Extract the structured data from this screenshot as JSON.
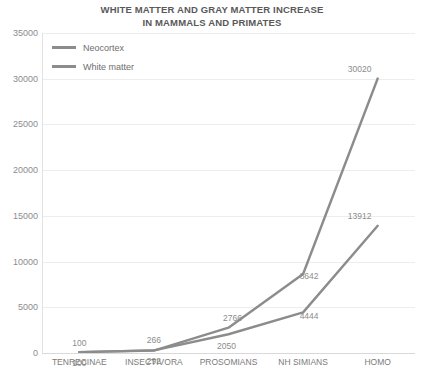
{
  "chart_data": {
    "type": "line",
    "title": "WHITE MATTER AND GRAY MATTER INCREASE IN MAMMALS AND PRIMATES",
    "title_line1": "WHITE MATTER AND GRAY MATTER INCREASE",
    "title_line2": "IN MAMMALS AND PRIMATES",
    "xlabel": "",
    "ylabel": "",
    "categories": [
      "TENRECINAE",
      "INSECTIVORA",
      "PROSOMIANS",
      "NH SIMIANS",
      "HOMO"
    ],
    "series": [
      {
        "name": "Neocortex",
        "color": "#8c8c8c",
        "values": [
          100,
          266,
          2766,
          8642,
          30020
        ],
        "labels": [
          "100",
          "266",
          "2766",
          "8642",
          "30020"
        ]
      },
      {
        "name": "White matter",
        "color": "#8c8c8c",
        "values": [
          100,
          292,
          2050,
          4444,
          13912
        ],
        "labels": [
          "100",
          "292",
          "2050",
          "4444",
          "13912"
        ]
      }
    ],
    "ylim": [
      0,
      35000
    ],
    "yticks": [
      0,
      5000,
      10000,
      15000,
      20000,
      25000,
      30000,
      35000
    ],
    "ytick_labels": [
      "0",
      "5000",
      "10000",
      "15000",
      "20000",
      "25000",
      "30000",
      "35000"
    ],
    "grid": true,
    "legend_position": "top-left",
    "gridline_color": "#ededed",
    "axis_color": "#d9d9d9",
    "text_color": "#8c8c8c",
    "title_color": "#595959"
  },
  "legend": {
    "items": [
      {
        "label": "Neocortex"
      },
      {
        "label": "White matter"
      }
    ]
  }
}
